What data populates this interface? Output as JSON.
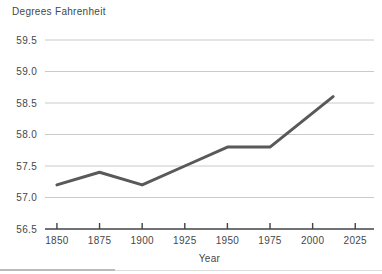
{
  "chart_data": {
    "type": "line",
    "title": "Degrees Fahrenheit",
    "xlabel": "Year",
    "ylabel": "Degrees Fahrenheit",
    "x": [
      1850,
      1875,
      1900,
      1925,
      1950,
      1975,
      2012
    ],
    "values": [
      57.2,
      57.4,
      57.2,
      57.5,
      57.8,
      57.8,
      58.6
    ],
    "x_ticks": [
      1850,
      1875,
      1900,
      1925,
      1950,
      1975,
      2000,
      2025
    ],
    "y_ticks": [
      59.5,
      59.0,
      58.5,
      58.0,
      57.5,
      57.0,
      56.5
    ],
    "xlim": [
      1843,
      2036
    ],
    "ylim": [
      56.5,
      59.5
    ],
    "grid": "horizontal",
    "legend": "none",
    "colors": {
      "line": "#58595b",
      "grid": "#c9cacb",
      "axis": "#414347",
      "text": "#44474a",
      "background": "#ffffff"
    }
  }
}
